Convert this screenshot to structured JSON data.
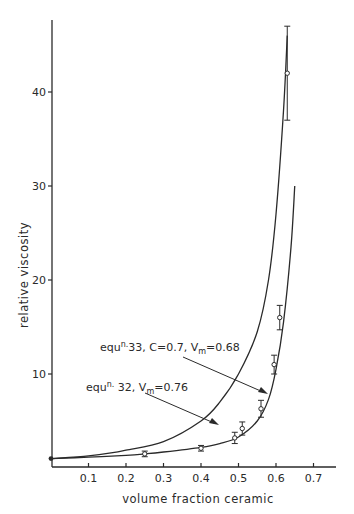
{
  "chart_data": {
    "type": "scatter",
    "title": "",
    "xlabel": "volume fraction ceramic",
    "ylabel": "relative viscosity",
    "xlim": [
      0,
      0.77
    ],
    "ylim": [
      0,
      47
    ],
    "grid": false,
    "x_ticks": [
      "0.1",
      "0.2",
      "0.3",
      "0.4",
      "0.5",
      "0.6",
      "0.7"
    ],
    "y_ticks": [
      "10",
      "20",
      "30",
      "40"
    ],
    "series": [
      {
        "name": "experimental data",
        "kind": "points_with_error_bars",
        "x": [
          0.0,
          0.25,
          0.4,
          0.49,
          0.51,
          0.56,
          0.595,
          0.61,
          0.63
        ],
        "y": [
          1.0,
          1.5,
          2.1,
          3.2,
          4.2,
          6.3,
          11.0,
          16.0,
          42.0
        ],
        "y_err_low": [
          0,
          0.3,
          0.3,
          0.6,
          0.7,
          0.9,
          1.0,
          1.3,
          5.0
        ],
        "y_err_high": [
          0,
          0.3,
          0.3,
          0.6,
          0.7,
          0.9,
          1.0,
          1.3,
          5.0
        ]
      },
      {
        "name": "equn. 33, C=0.7, Vm=0.68",
        "kind": "line",
        "x": [
          0.0,
          0.1,
          0.2,
          0.25,
          0.3,
          0.4,
          0.45,
          0.5,
          0.55,
          0.58,
          0.6,
          0.62,
          0.64,
          0.65
        ],
        "y": [
          1.0,
          1.15,
          1.35,
          1.5,
          1.7,
          2.2,
          2.6,
          3.3,
          5.0,
          7.3,
          10.5,
          15.5,
          23.5,
          30.0
        ]
      },
      {
        "name": "equn. 32, Vm=0.76",
        "kind": "line",
        "x": [
          0.0,
          0.1,
          0.16,
          0.2,
          0.3,
          0.4,
          0.45,
          0.5,
          0.55,
          0.58,
          0.6,
          0.62,
          0.63
        ],
        "y": [
          1.0,
          1.3,
          1.6,
          1.9,
          2.8,
          5.0,
          7.0,
          10.0,
          14.5,
          20.0,
          27.0,
          38.0,
          46.0
        ]
      }
    ],
    "annotations": [
      {
        "text_main": "equ",
        "text_sup": "n.",
        "text_rest": "33, C=0.7, V",
        "text_sub": "m",
        "text_end": "=0.68",
        "points_to": "equn. 33 curve near x≈0.59"
      },
      {
        "text_main": "equ",
        "text_sup": "n.",
        "text_rest": " 32, V",
        "text_sub": "m",
        "text_end": "=0.76",
        "points_to": "equn. 32 curve near x≈0.47"
      }
    ]
  }
}
